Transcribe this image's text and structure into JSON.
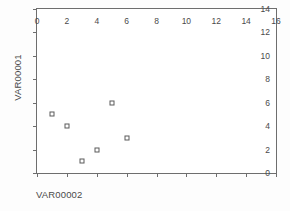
{
  "chart_data": {
    "type": "scatter",
    "title": "",
    "xlabel": "VAR00002",
    "ylabel": "VAR00001",
    "xlim": [
      0,
      16
    ],
    "ylim": [
      0,
      14
    ],
    "xticks": [
      0,
      2,
      4,
      6,
      8,
      10,
      12,
      14,
      16
    ],
    "yticks": [
      0,
      2,
      4,
      6,
      8,
      10,
      12,
      14
    ],
    "xtick_labels": [
      "0",
      "2",
      "4",
      "6",
      "8",
      "10",
      "12",
      "14",
      "16"
    ],
    "ytick_labels": [
      "0",
      "2",
      "4",
      "6",
      "8",
      "10",
      "12",
      "14"
    ],
    "grid": false,
    "legend": null,
    "marker": "open-square",
    "marker_color": "#5a5a5a",
    "axis_color": "#6e6e6e",
    "points": [
      {
        "x": 1,
        "y": 5
      },
      {
        "x": 2,
        "y": 4
      },
      {
        "x": 3,
        "y": 1
      },
      {
        "x": 4,
        "y": 2
      },
      {
        "x": 5,
        "y": 6
      },
      {
        "x": 6,
        "y": 3
      }
    ]
  }
}
